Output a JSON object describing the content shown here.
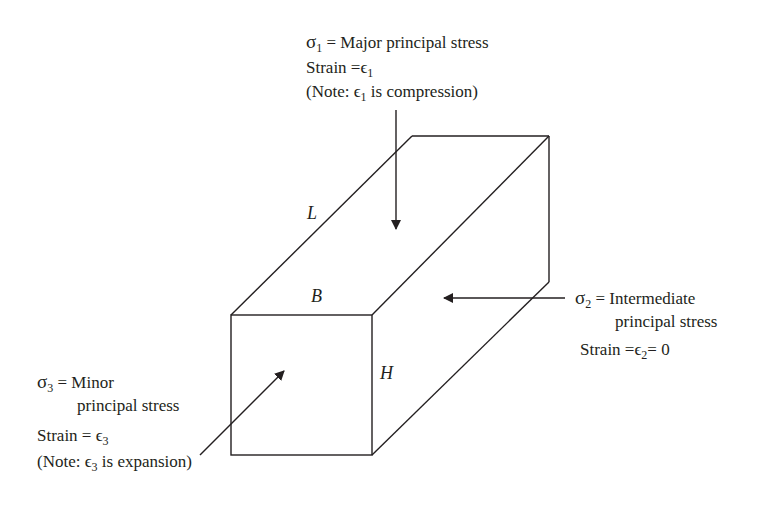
{
  "figure": {
    "type": "principal stress block (plane strain)",
    "colors": {
      "line": "#231f20",
      "background": "#ffffff"
    },
    "dimensions": {
      "length": "L",
      "breadth": "B",
      "height": "H"
    },
    "sigma1": {
      "symbol": "σ",
      "subscript": "1",
      "eq": "=",
      "label": "Major principal stress",
      "strain_prefix": "Strain =",
      "strain_symbol": "ϵ",
      "strain_sub": "1",
      "note_open": "(Note: ",
      "note_symbol": "ϵ",
      "note_sub": "1",
      "note_rest": " is compression)"
    },
    "sigma2": {
      "symbol": "σ",
      "subscript": "2",
      "eq": "=",
      "label_line1": "Intermediate",
      "label_line2": "principal stress",
      "strain_prefix": "Strain =",
      "strain_symbol": "ϵ",
      "strain_sub": "2",
      "strain_suffix": "= 0"
    },
    "sigma3": {
      "symbol": "σ",
      "subscript": "3",
      "eq": "=",
      "label_line1": "Minor",
      "label_line2": "principal stress",
      "strain_prefix": "Strain =",
      "strain_symbol": "ϵ",
      "strain_sub": "3",
      "note_open": "(Note: ",
      "note_symbol": "ϵ",
      "note_sub": "3",
      "note_rest": " is expansion)"
    }
  }
}
